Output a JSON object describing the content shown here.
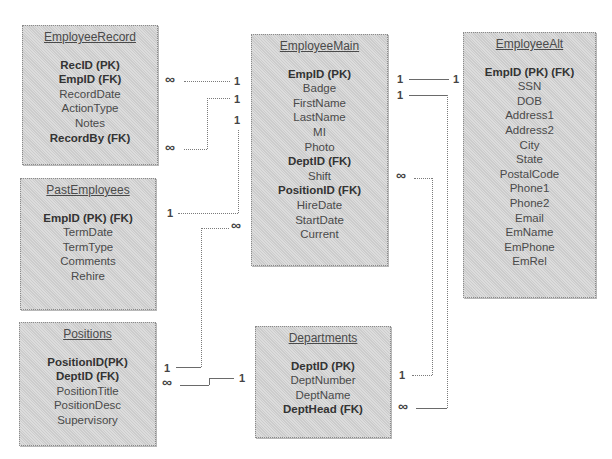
{
  "tables": {
    "employee_record": {
      "title": "EmployeeRecord",
      "fields": [
        {
          "name": "RecID (PK)",
          "key": true
        },
        {
          "name": "EmpID (FK)",
          "key": true
        },
        {
          "name": "RecordDate",
          "key": false
        },
        {
          "name": "ActionType",
          "key": false
        },
        {
          "name": "Notes",
          "key": false
        },
        {
          "name": "RecordBy (FK)",
          "key": true
        }
      ]
    },
    "past_employees": {
      "title": "PastEmployees",
      "fields": [
        {
          "name": "EmpID (PK) (FK)",
          "key": true
        },
        {
          "name": "TermDate",
          "key": false
        },
        {
          "name": "TermType",
          "key": false
        },
        {
          "name": "Comments",
          "key": false
        },
        {
          "name": "Rehire",
          "key": false
        }
      ]
    },
    "positions": {
      "title": "Positions",
      "fields": [
        {
          "name": "PositionID(PK)",
          "key": true
        },
        {
          "name": "DeptID (FK)",
          "key": true
        },
        {
          "name": "PositionTitle",
          "key": false
        },
        {
          "name": "PositionDesc",
          "key": false
        },
        {
          "name": "Supervisory",
          "key": false
        }
      ]
    },
    "employee_main": {
      "title": "EmployeeMain",
      "fields": [
        {
          "name": "EmpID (PK)",
          "key": true
        },
        {
          "name": "Badge",
          "key": false
        },
        {
          "name": "FirstName",
          "key": false
        },
        {
          "name": "LastName",
          "key": false
        },
        {
          "name": "MI",
          "key": false
        },
        {
          "name": "Photo",
          "key": false
        },
        {
          "name": "DeptID (FK)",
          "key": true
        },
        {
          "name": "Shift",
          "key": false
        },
        {
          "name": "PositionID (FK)",
          "key": true
        },
        {
          "name": "HireDate",
          "key": false
        },
        {
          "name": "StartDate",
          "key": false
        },
        {
          "name": "Current",
          "key": false
        }
      ]
    },
    "departments": {
      "title": "Departments",
      "fields": [
        {
          "name": "DeptID (PK)",
          "key": true
        },
        {
          "name": "DeptNumber",
          "key": false
        },
        {
          "name": "DeptName",
          "key": false
        },
        {
          "name": "DeptHead (FK)",
          "key": true
        }
      ]
    },
    "employee_alt": {
      "title": "EmployeeAlt",
      "fields": [
        {
          "name": "EmpID (PK) (FK)",
          "key": true
        },
        {
          "name": "SSN",
          "key": false
        },
        {
          "name": "DOB",
          "key": false
        },
        {
          "name": "Address1",
          "key": false
        },
        {
          "name": "Address2",
          "key": false
        },
        {
          "name": "City",
          "key": false
        },
        {
          "name": "State",
          "key": false
        },
        {
          "name": "PostalCode",
          "key": false
        },
        {
          "name": "Phone1",
          "key": false
        },
        {
          "name": "Phone2",
          "key": false
        },
        {
          "name": "Email",
          "key": false
        },
        {
          "name": "EmName",
          "key": false
        },
        {
          "name": "EmPhone",
          "key": false
        },
        {
          "name": "EmRel",
          "key": false
        }
      ]
    }
  },
  "cardinality": {
    "one": "1",
    "many": "∞"
  },
  "relationships": [
    {
      "from": "EmployeeRecord.EmpID",
      "from_card": "∞",
      "to": "EmployeeMain.EmpID",
      "to_card": "1"
    },
    {
      "from": "EmployeeRecord.RecordBy",
      "from_card": "∞",
      "to": "EmployeeMain.EmpID",
      "to_card": "1"
    },
    {
      "from": "PastEmployees.EmpID",
      "from_card": "1",
      "to": "EmployeeMain.EmpID",
      "to_card": "1"
    },
    {
      "from": "Positions.PositionID",
      "from_card": "1",
      "to": "EmployeeMain.PositionID",
      "to_card": "∞"
    },
    {
      "from": "Positions.DeptID",
      "from_card": "∞",
      "to": "Departments.DeptID",
      "to_card": "1"
    },
    {
      "from": "EmployeeMain.EmpID",
      "from_card": "1",
      "to": "EmployeeAlt.EmpID",
      "to_card": "1"
    },
    {
      "from": "EmployeeMain.EmpID",
      "from_card": "1",
      "to": "Departments.DeptHead",
      "to_card": "∞"
    },
    {
      "from": "EmployeeMain.DeptID",
      "from_card": "∞",
      "to": "Departments.DeptID",
      "to_card": "1"
    }
  ]
}
